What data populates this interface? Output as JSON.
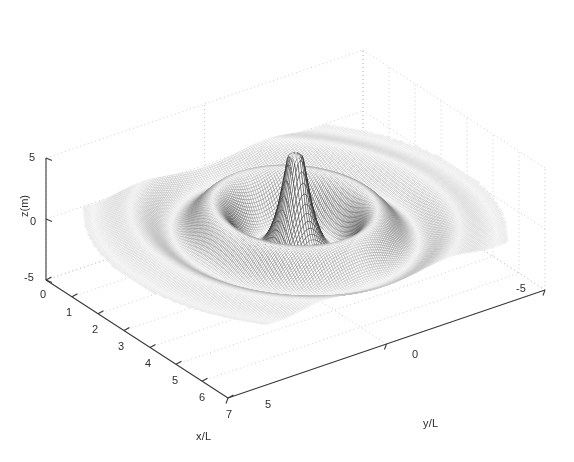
{
  "figure": {
    "type": "3d-mesh-surface",
    "background": "#ffffff",
    "mesh_color": "#4a4a4a",
    "axis_color": "#3a3a3a",
    "grid_color": "#b9b9b9"
  },
  "axes": {
    "x": {
      "label": "x/L",
      "ticks": [
        "0",
        "1",
        "2",
        "3",
        "4",
        "5",
        "6",
        "7"
      ],
      "range": [
        0,
        7
      ]
    },
    "y": {
      "label": "y/L",
      "ticks": [
        "5",
        "0",
        "-5"
      ],
      "range": [
        5,
        -5
      ]
    },
    "z": {
      "label": "z(m)",
      "ticks": [
        "5",
        "0",
        "-5"
      ],
      "range": [
        -5,
        5
      ]
    }
  },
  "chart_data": {
    "type": "surface",
    "title": "",
    "xlabel": "x/L",
    "ylabel": "y/L",
    "zlabel": "z(m)",
    "xlim": [
      0,
      7
    ],
    "ylim": [
      -5,
      5
    ],
    "zlim": [
      -5,
      5
    ],
    "grid": true,
    "legend": null,
    "xticks": [
      0,
      1,
      2,
      3,
      4,
      5,
      6,
      7
    ],
    "yticks": [
      5,
      0,
      -5
    ],
    "zticks": [
      -5,
      0,
      5
    ],
    "surface_model": {
      "family": "damped-radial-ripple-with-spike",
      "center_x": 3.5,
      "center_y": 0.0,
      "ripple_amplitude": 2.4,
      "ripple_wavenumber": 3.05,
      "ripple_decay": 0.22,
      "spike_amplitude": 5.0,
      "spike_width": 0.22,
      "nx": 150,
      "ny": 150,
      "domain_radius": 5.2
    },
    "view": {
      "azimuth_deg": -37.5,
      "elevation_deg": 26
    }
  }
}
